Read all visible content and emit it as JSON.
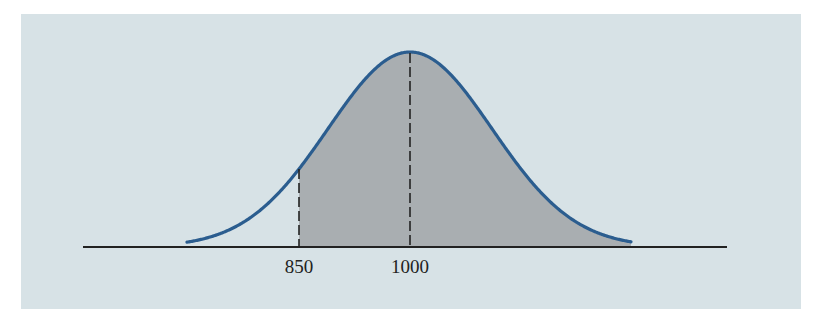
{
  "chart_data": {
    "type": "area",
    "title": "",
    "xlabel": "",
    "ylabel": "",
    "distribution": {
      "mean": 1000,
      "shaded_from": 850,
      "shaded_to": "+inf"
    },
    "tick_labels": [
      "850",
      "1000"
    ],
    "tick_values": [
      850,
      1000
    ],
    "markers": [
      {
        "value": 850,
        "style": "dashed"
      },
      {
        "value": 1000,
        "style": "dashed"
      }
    ],
    "grid": false,
    "legend": null
  },
  "colors": {
    "background": "#d7e2e6",
    "curve": "#2b5d8f",
    "shade": "#a9aeb1",
    "axis": "#222222"
  },
  "labels": {
    "tick_850": "850",
    "tick_1000": "1000"
  }
}
